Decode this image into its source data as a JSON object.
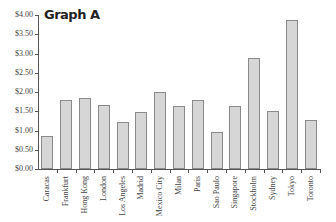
{
  "chart_data": {
    "type": "bar",
    "title": "Graph A",
    "xlabel": "",
    "ylabel": "",
    "ylim": [
      0,
      4
    ],
    "grid": false,
    "legend": null,
    "yticks": [
      "$0.00",
      "$0.50",
      "$1.00",
      "$1.50",
      "$2.00",
      "$2.50",
      "$3.00",
      "$3.50",
      "$4.00"
    ],
    "categories": [
      "Caracas",
      "Frankfurt",
      "Hong Kong",
      "London",
      "Los Angeles",
      "Madrid",
      "Mexico City",
      "Milan",
      "Paris",
      "Sao Paulo",
      "Singapore",
      "Stockholm",
      "Sydney",
      "Tokyo",
      "Toronto"
    ],
    "values": [
      0.86,
      1.79,
      1.85,
      1.66,
      1.21,
      1.47,
      2.0,
      1.64,
      1.79,
      0.97,
      1.64,
      2.88,
      1.5,
      3.87,
      1.27
    ],
    "colors": {
      "bar_fill": "#d6d6d6",
      "bar_border": "#8a8a8a",
      "axis": "#555555"
    }
  }
}
